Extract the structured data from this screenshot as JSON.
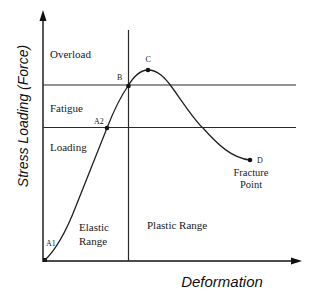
{
  "diagram": {
    "axes": {
      "y_label": "Stress Loading (Force)",
      "x_label": "Deformation"
    },
    "zones": {
      "overload": "Overload",
      "fatigue": "Fatigue",
      "loading": "Loading"
    },
    "ranges": {
      "elastic_line1": "Elastic",
      "elastic_line2": "Range",
      "plastic": "Plastic Range"
    },
    "points": {
      "a1": "A1",
      "a2": "A2",
      "b": "B",
      "c": "C",
      "d": "D"
    },
    "annotations": {
      "fracture_line1": "Fracture",
      "fracture_line2": "Point"
    },
    "colors": {
      "ink": "#1a1a1a",
      "background": "#ffffff"
    }
  }
}
